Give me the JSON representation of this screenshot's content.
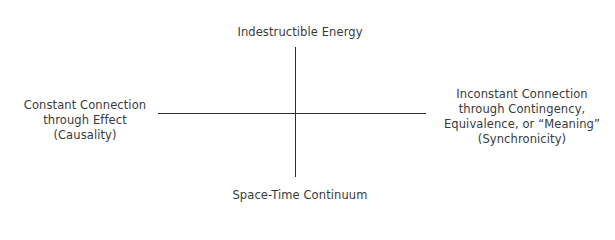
{
  "diagram": {
    "type": "quadrant-cross",
    "axes": {
      "vertical": {
        "top_label": "Indestructible Energy",
        "bottom_label": "Space-Time Continuum"
      },
      "horizontal": {
        "left_label": {
          "lines": [
            "Constant Connection",
            "through Effect",
            "(Causality)"
          ]
        },
        "right_label": {
          "lines": [
            "Inconstant Connection",
            "through Contingency,",
            "Equivalence, or “Meaning”",
            "(Synchronicity)"
          ]
        }
      }
    },
    "colors": {
      "background": "#ffffff",
      "text": "#3a3a3a",
      "axis_line": "#2e2e2e"
    }
  }
}
